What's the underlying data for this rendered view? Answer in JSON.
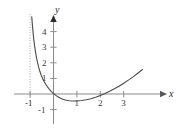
{
  "figure": {
    "background_color": "#ffffff",
    "curve_color": "#4a4a4a",
    "axis_color": "#8c8c8c",
    "asymptote_color": "#a8a8a8",
    "label_color": "#3a3a3a"
  },
  "axes": {
    "x_name": "x",
    "y_name": "y"
  },
  "chart_data": {
    "type": "line",
    "title": "",
    "xlabel": "x",
    "ylabel": "y",
    "xlim": [
      -1.35,
      3.95
    ],
    "ylim": [
      -1.45,
      5.1
    ],
    "grid": false,
    "legend": null,
    "x_ticks": [
      -1,
      1,
      2,
      3
    ],
    "x_tick_labels": [
      "-1",
      "1",
      "2",
      "3"
    ],
    "y_ticks": [
      -1,
      1,
      2,
      3,
      4
    ],
    "y_tick_labels": [
      "-1",
      "1",
      "2",
      "3",
      "4"
    ],
    "annotations": [
      {
        "kind": "vertical-asymptote",
        "x": -1,
        "style": "dotted"
      }
    ],
    "series": [
      {
        "name": "curve",
        "style": "solid",
        "x": [
          -0.93,
          -0.9,
          -0.87,
          -0.84,
          -0.8,
          -0.76,
          -0.72,
          -0.68,
          -0.63,
          -0.58,
          -0.52,
          -0.46,
          -0.4,
          -0.33,
          -0.26,
          -0.18,
          -0.1,
          0.0,
          0.1,
          0.22,
          0.35,
          0.5,
          0.66,
          0.83,
          1.0,
          1.2,
          1.4,
          1.6,
          1.8,
          2.0,
          2.2,
          2.4,
          2.6,
          2.8,
          3.0,
          3.2,
          3.4,
          3.6,
          3.8
        ],
        "y": [
          4.95,
          4.4,
          3.9,
          3.45,
          3.0,
          2.62,
          2.28,
          1.99,
          1.7,
          1.44,
          1.19,
          0.98,
          0.8,
          0.62,
          0.46,
          0.31,
          0.17,
          0.03,
          -0.09,
          -0.21,
          -0.3,
          -0.38,
          -0.43,
          -0.45,
          -0.45,
          -0.42,
          -0.37,
          -0.3,
          -0.21,
          -0.1,
          0.03,
          0.17,
          0.33,
          0.5,
          0.69,
          0.89,
          1.1,
          1.33,
          1.57
        ]
      }
    ]
  },
  "tick_positions": {
    "x_axis_y_px": 94,
    "y_axis_x_px": 53.5,
    "unit_x_px": 23.4,
    "unit_y_px": 15.6
  }
}
